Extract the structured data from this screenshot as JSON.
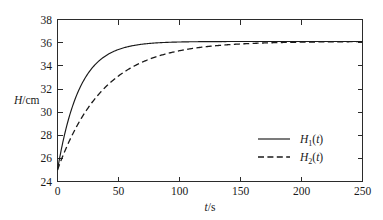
{
  "chart_data": {
    "type": "line",
    "title": "",
    "xlabel": "t/s",
    "ylabel": "H/cm",
    "xlim": [
      0,
      250
    ],
    "ylim": [
      24,
      38
    ],
    "xticks": [
      0,
      50,
      100,
      150,
      200,
      250
    ],
    "yticks": [
      24,
      26,
      28,
      30,
      32,
      34,
      36,
      38
    ],
    "xtick_labels": [
      "0",
      "50",
      "100",
      "150",
      "200",
      "250"
    ],
    "ytick_labels": [
      "24",
      "26",
      "28",
      "30",
      "32",
      "34",
      "36",
      "38"
    ],
    "grid": false,
    "legend_position": "center right inside",
    "frame": "box",
    "tick_direction": "in",
    "series": [
      {
        "name": "H1(t)",
        "label_base": "H",
        "label_sub": "1",
        "label_arg": "(t)",
        "style": "solid",
        "color": "#1a1a1a",
        "model": "H(t) = 36.1 - 11.1*exp(-t/18)",
        "initial_value": 25.0,
        "asymptote": 36.1,
        "time_constant_s": 18,
        "x": [
          0,
          5,
          10,
          15,
          20,
          25,
          30,
          40,
          50,
          60,
          70,
          80,
          90,
          100,
          120,
          140,
          160,
          180,
          200,
          220,
          250
        ],
        "y": [
          25.0,
          27.6,
          29.7,
          31.3,
          32.5,
          33.4,
          34.2,
          35.1,
          35.4,
          35.7,
          35.9,
          36.0,
          36.0,
          36.1,
          36.1,
          36.1,
          36.1,
          36.1,
          36.1,
          36.1,
          36.1
        ]
      },
      {
        "name": "H2(t)",
        "label_base": "H",
        "label_sub": "2",
        "label_arg": "(t)",
        "style": "dashed",
        "color": "#1a1a1a",
        "model": "H(t) = 36.1 - 11.1*exp(-t/38)",
        "initial_value": 25.0,
        "asymptote": 36.1,
        "time_constant_s": 38,
        "x": [
          0,
          5,
          10,
          15,
          20,
          25,
          30,
          40,
          50,
          60,
          70,
          80,
          90,
          100,
          120,
          140,
          160,
          180,
          200,
          220,
          250
        ],
        "y": [
          25.0,
          26.4,
          27.6,
          28.7,
          29.7,
          30.5,
          31.3,
          32.5,
          33.4,
          34.2,
          34.7,
          35.1,
          35.4,
          35.6,
          35.9,
          36.0,
          36.1,
          36.1,
          36.1,
          36.1,
          36.1
        ]
      }
    ]
  },
  "axes": {
    "ylabel_italic": "H",
    "ylabel_rest": "/cm",
    "xlabel_italic": "t",
    "xlabel_rest": "/s"
  },
  "legend": {
    "entries": [
      {
        "base": "H",
        "sub": "1",
        "arg": "(t)",
        "style": "solid"
      },
      {
        "base": "H",
        "sub": "2",
        "arg": "(t)",
        "style": "dashed"
      }
    ]
  }
}
